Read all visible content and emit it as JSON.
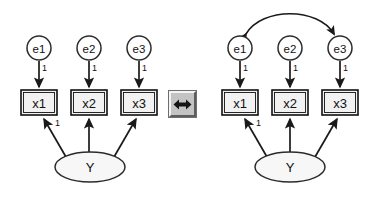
{
  "figure": {
    "background_color": "#ffffff",
    "node_fill_box": "#f2f2f2",
    "node_fill_circle": "#ffffff",
    "node_fill_ellipse": "#f7f7f7",
    "stroke_color": "#1a1a1a"
  },
  "panels": [
    {
      "id": "left-panel",
      "name": "uncorrelated-errors-model",
      "errors": [
        {
          "label": "e1",
          "cx": 39,
          "cy": 48,
          "r": 12
        },
        {
          "label": "e2",
          "cx": 89,
          "cy": 48,
          "r": 12
        },
        {
          "label": "e3",
          "cx": 139,
          "cy": 48,
          "r": 12
        }
      ],
      "indicators": [
        {
          "label": "x1",
          "x": 21,
          "y": 90,
          "w": 36,
          "h": 25
        },
        {
          "label": "x2",
          "x": 71,
          "y": 90,
          "w": 36,
          "h": 25
        },
        {
          "label": "x3",
          "x": 121,
          "y": 90,
          "w": 36,
          "h": 25
        }
      ],
      "latent": {
        "label": "Y",
        "cx": 90,
        "cy": 167,
        "rx": 35,
        "ry": 15
      },
      "error_paths": [
        {
          "from": "e1",
          "to": "x1",
          "coefficient": "1"
        },
        {
          "from": "e2",
          "to": "x2",
          "coefficient": "1"
        },
        {
          "from": "e3",
          "to": "x3",
          "coefficient": "1"
        }
      ],
      "loading_paths": [
        {
          "from": "Y",
          "to": "x1",
          "coefficient": "1"
        },
        {
          "from": "Y",
          "to": "x2",
          "coefficient": ""
        },
        {
          "from": "Y",
          "to": "x3",
          "coefficient": ""
        }
      ],
      "correlation": null
    },
    {
      "id": "right-panel",
      "name": "correlated-errors-model",
      "errors": [
        {
          "label": "e1",
          "cx": 240,
          "cy": 48,
          "r": 12
        },
        {
          "label": "e2",
          "cx": 290,
          "cy": 48,
          "r": 12
        },
        {
          "label": "e3",
          "cx": 340,
          "cy": 48,
          "r": 12
        }
      ],
      "indicators": [
        {
          "label": "x1",
          "x": 222,
          "y": 90,
          "w": 36,
          "h": 25
        },
        {
          "label": "x2",
          "x": 272,
          "y": 90,
          "w": 36,
          "h": 25
        },
        {
          "label": "x3",
          "x": 322,
          "y": 90,
          "w": 36,
          "h": 25
        }
      ],
      "latent": {
        "label": "Y",
        "cx": 290,
        "cy": 167,
        "rx": 35,
        "ry": 15
      },
      "error_paths": [
        {
          "from": "e1",
          "to": "x1",
          "coefficient": "1"
        },
        {
          "from": "e2",
          "to": "x2",
          "coefficient": "1"
        },
        {
          "from": "e3",
          "to": "x3",
          "coefficient": "1"
        }
      ],
      "loading_paths": [
        {
          "from": "Y",
          "to": "x1",
          "coefficient": "1"
        },
        {
          "from": "Y",
          "to": "x2",
          "coefficient": ""
        },
        {
          "from": "Y",
          "to": "x3",
          "coefficient": ""
        }
      ],
      "correlation": {
        "from": "e1",
        "to": "e3",
        "style": "double-headed-curved-arc",
        "label": ""
      }
    }
  ],
  "toggle": {
    "icon": "double-headed-horizontal-arrow-icon",
    "tooltip": "",
    "style": "beveled-3d-button"
  }
}
